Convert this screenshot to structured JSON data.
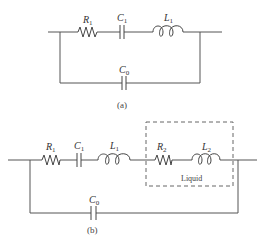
{
  "diagram": {
    "type": "circuit-schematic",
    "colors": {
      "wire": "#555555",
      "component": "#444444",
      "text": "#333333",
      "background": "#ffffff"
    },
    "circuit_a": {
      "caption": "(a)",
      "series_branch": [
        {
          "type": "resistor",
          "symbol": "R",
          "subscript": "1"
        },
        {
          "type": "capacitor",
          "symbol": "C",
          "subscript": "1"
        },
        {
          "type": "inductor",
          "symbol": "L",
          "subscript": "1"
        }
      ],
      "parallel_branch": [
        {
          "type": "capacitor",
          "symbol": "C",
          "subscript": "0"
        }
      ]
    },
    "circuit_b": {
      "caption": "(b)",
      "series_branch": [
        {
          "type": "resistor",
          "symbol": "R",
          "subscript": "1"
        },
        {
          "type": "capacitor",
          "symbol": "C",
          "subscript": "1"
        },
        {
          "type": "inductor",
          "symbol": "L",
          "subscript": "1"
        },
        {
          "type": "resistor",
          "symbol": "R",
          "subscript": "2"
        },
        {
          "type": "inductor",
          "symbol": "L",
          "subscript": "2"
        }
      ],
      "parallel_branch": [
        {
          "type": "capacitor",
          "symbol": "C",
          "subscript": "0"
        }
      ],
      "dashed_box_label": "Liquid"
    }
  }
}
